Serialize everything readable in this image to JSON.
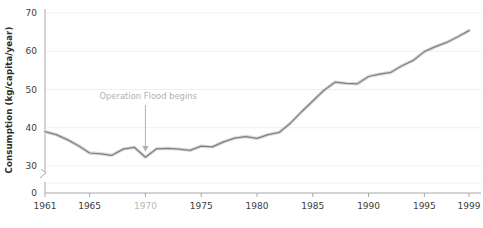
{
  "chart_data": {
    "type": "line",
    "title": "",
    "xlabel": "",
    "ylabel": "Consumption (kg/capita/year)",
    "xlim": [
      1961,
      1999
    ],
    "ylim": [
      28.5,
      70
    ],
    "yticks": [
      0,
      30,
      40,
      50,
      60,
      70
    ],
    "ytick_labels": [
      "0",
      "30",
      "40",
      "50",
      "60",
      "70"
    ],
    "xticks": [
      1961,
      1965,
      1970,
      1975,
      1980,
      1985,
      1990,
      1995,
      1999
    ],
    "xtick_labels": [
      "1961",
      "1965",
      "1970",
      "1975",
      "1980",
      "1985",
      "1990",
      "1995",
      "1999"
    ],
    "highlighted_xtick": "1970",
    "grid": "horizontal",
    "legend": "none",
    "axis_break": {
      "axis": "y",
      "between": [
        0,
        30
      ],
      "symbol": "zigzag"
    },
    "line_color": "#808080",
    "grid_color": "#f0f0f0",
    "axis_color": "#a8a8a8",
    "annotation_color": "#b0b0b0",
    "annotations": [
      {
        "text": "Operation Flood begins",
        "x": 1970,
        "y": 47.5,
        "arrow_to_y": 33.8,
        "arrow": "down"
      }
    ],
    "x": [
      1961,
      1962,
      1963,
      1964,
      1965,
      1966,
      1967,
      1968,
      1969,
      1970,
      1971,
      1972,
      1973,
      1974,
      1975,
      1976,
      1977,
      1978,
      1979,
      1980,
      1981,
      1982,
      1983,
      1984,
      1985,
      1986,
      1987,
      1988,
      1989,
      1990,
      1991,
      1992,
      1993,
      1994,
      1995,
      1996,
      1997,
      1998,
      1999
    ],
    "values": [
      39.0,
      38.2,
      36.9,
      35.3,
      33.4,
      33.2,
      32.8,
      34.4,
      34.9,
      32.3,
      34.5,
      34.6,
      34.4,
      34.1,
      35.2,
      35.0,
      36.3,
      37.3,
      37.7,
      37.2,
      38.2,
      38.8,
      41.2,
      44.2,
      47.0,
      49.8,
      51.9,
      51.6,
      51.5,
      53.4,
      54.0,
      54.5,
      56.2,
      57.6,
      59.9,
      61.2,
      62.3,
      63.8,
      65.4
    ],
    "series_name": "Milk consumption"
  }
}
